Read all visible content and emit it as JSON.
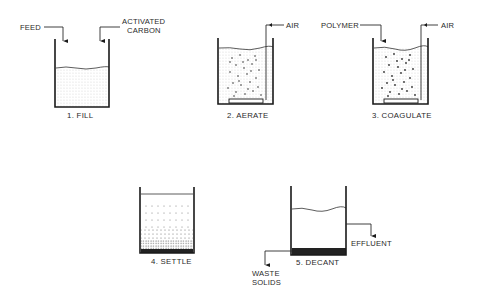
{
  "diagram": {
    "type": "process-flow",
    "stages": [
      {
        "id": "fill",
        "number": "1.",
        "name": "FILL",
        "label": "1.  FILL",
        "inputs": [
          "FEED",
          "ACTIVATED CARBON"
        ]
      },
      {
        "id": "aerate",
        "number": "2.",
        "name": "AERATE",
        "label": "2.  AERATE",
        "inputs": [
          "AIR"
        ]
      },
      {
        "id": "coagulate",
        "number": "3.",
        "name": "COAGULATE",
        "label": "3.  COAGULATE",
        "inputs": [
          "POLYMER",
          "AIR"
        ]
      },
      {
        "id": "settle",
        "number": "4.",
        "name": "SETTLE",
        "label": "4.  SETTLE",
        "inputs": []
      },
      {
        "id": "decant",
        "number": "5.",
        "name": "DECANT",
        "label": "5.  DECANT",
        "outputs": [
          "EFFLUENT",
          "WASTE SOLIDS"
        ]
      }
    ],
    "streams": {
      "feed": "FEED",
      "carbon_line1": "ACTIVATED",
      "carbon_line2": "CARBON",
      "air_aerate": "AIR",
      "polymer": "POLYMER",
      "air_coagulate": "AIR",
      "effluent": "EFFLUENT",
      "waste_line1": "WASTE",
      "waste_line2": "SOLIDS"
    },
    "colors": {
      "line": "#1a1a1a",
      "text": "#2a2a2a",
      "background": "#ffffff",
      "sludge": "#222222"
    }
  }
}
